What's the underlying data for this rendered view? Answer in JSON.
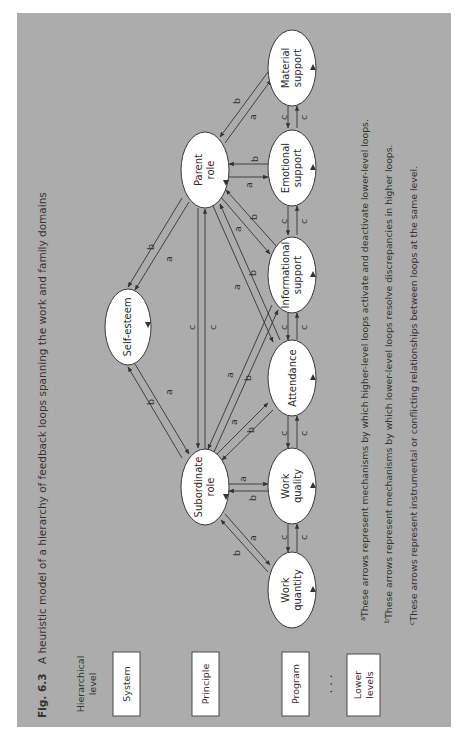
{
  "caption": {
    "number": "Fig. 6.3",
    "title": "A heuristic model of a hierarchy of feedback loops spanning the work and family domains"
  },
  "levels": {
    "header_line1": "Hierarchical",
    "header_line2": "level",
    "items": [
      {
        "label": "System"
      },
      {
        "label": "Principle"
      },
      {
        "label": "Program"
      },
      {
        "label_line1": "Lower",
        "label_line2": "levels"
      }
    ],
    "ellipsis": ". . ."
  },
  "nodes": {
    "self_esteem": {
      "line1": "Self-esteem"
    },
    "subordinate_role": {
      "line1": "Subordinate",
      "line2": "role"
    },
    "parent_role": {
      "line1": "Parent",
      "line2": "role"
    },
    "work_quantity": {
      "line1": "Work",
      "line2": "quantity"
    },
    "work_quality": {
      "line1": "Work",
      "line2": "quality"
    },
    "attendance": {
      "line1": "Attendance"
    },
    "informational_support": {
      "line1": "Informational",
      "line2": "support"
    },
    "emotional_support": {
      "line1": "Emotional",
      "line2": "support"
    },
    "material_support": {
      "line1": "Material",
      "line2": "support"
    }
  },
  "edge_labels": {
    "a": "a",
    "b": "b",
    "c": "c"
  },
  "footnotes": [
    {
      "mark": "a",
      "text": "These arrows represent mechanisms by which higher-level loops activate and deactivate lower-level loops."
    },
    {
      "mark": "b",
      "text": "These arrows represent mechanisms by which lower-level loops resolve discrepancies in higher loops."
    },
    {
      "mark": "c",
      "text": "These arrows represent instrumental or conflicting relationships between loops at the same level."
    }
  ],
  "colors": {
    "background": "#acacac",
    "node_fill": "#ffffff",
    "stroke": "#333333"
  }
}
